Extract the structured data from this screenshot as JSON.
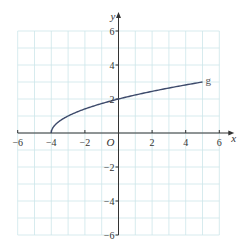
{
  "chart_data": {
    "type": "line",
    "title": "",
    "xlabel": "x",
    "ylabel": "y",
    "origin_label": "O",
    "xlim": [
      -6,
      6
    ],
    "ylim": [
      -6,
      6
    ],
    "grid": true,
    "grid_step": 1,
    "x_ticks": [
      -6,
      -4,
      -2,
      2,
      4,
      6
    ],
    "y_ticks": [
      6,
      4,
      2,
      -2,
      -4,
      -6
    ],
    "x_tick_labels": [
      "−6",
      "−4",
      "−2",
      "2",
      "4",
      "6"
    ],
    "y_tick_labels": [
      "6",
      "4",
      "2",
      "−2",
      "−4",
      "−6"
    ],
    "series": [
      {
        "name": "g",
        "expression": "sqrt(x+4)",
        "x": [
          -4,
          -3.75,
          -3,
          -2,
          -1,
          0,
          1,
          2,
          3,
          4,
          5
        ],
        "values": [
          0,
          0.5,
          1,
          1.414,
          1.732,
          2,
          2.236,
          2.449,
          2.646,
          2.828,
          3
        ],
        "label_position": [
          5,
          3
        ]
      }
    ]
  },
  "colors": {
    "grid": "#cde6ea",
    "axis": "#333333",
    "curve": "#3d4a6b"
  }
}
